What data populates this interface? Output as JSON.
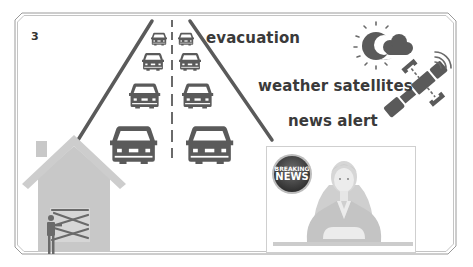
{
  "slide": {
    "page_number": "3",
    "labels": {
      "evacuation": "evacuation",
      "weather_satellites": "weather satellites",
      "news_alert": "news alert"
    },
    "news_badge": {
      "line1": "BREAKING",
      "line2": "NEWS"
    },
    "illustrations": [
      "highway-traffic-icon",
      "house-boarded-door-icon",
      "sun-moon-cloud-weather-icon",
      "satellite-icon",
      "news-anchor-tv-icon",
      "breaking-news-badge-icon"
    ]
  },
  "colors": {
    "ink_dark": "#5a5a5a",
    "ink_light": "#c8c8c8",
    "frame": "#9a9a9a",
    "text": "#3a3a3a",
    "background": "#ffffff"
  }
}
